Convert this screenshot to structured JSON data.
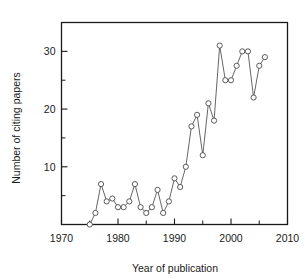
{
  "chart_data": {
    "type": "line",
    "title": "",
    "subtitle": "",
    "xlabel": "Year of publication",
    "ylabel": "Number of citing papers",
    "xlim": [
      1970,
      2010
    ],
    "ylim": [
      0,
      35
    ],
    "grid": false,
    "legend": null,
    "marker": "open-circle",
    "line_color": "#555555",
    "marker_face_color": "#ffffff",
    "marker_edge_color": "#4a4a4a",
    "x_ticks_major": [
      1970,
      1980,
      1990,
      2000,
      2010
    ],
    "x_tick_labels": [
      "1970",
      "1980",
      "1990",
      "2000",
      "2010"
    ],
    "x_ticks_minor": [
      1975,
      1985,
      1995,
      2005
    ],
    "y_ticks_major": [
      10,
      20,
      30
    ],
    "y_tick_labels": [
      "10",
      "20",
      "30"
    ],
    "y_ticks_minor": [
      5,
      15,
      25,
      35
    ],
    "x": [
      1975,
      1976,
      1977,
      1978,
      1979,
      1980,
      1981,
      1982,
      1983,
      1984,
      1985,
      1986,
      1987,
      1988,
      1989,
      1990,
      1991,
      1992,
      1993,
      1994,
      1995,
      1996,
      1997,
      1998,
      1999,
      2000,
      2001,
      2002,
      2003,
      2004,
      2005,
      2006
    ],
    "values": [
      0,
      2,
      7,
      4,
      4.5,
      3,
      3,
      4,
      7,
      3,
      2,
      3,
      6,
      2,
      4,
      8,
      6.5,
      10,
      17,
      19,
      12,
      21,
      18,
      31,
      25,
      25,
      27.5,
      30,
      30,
      22,
      27.5,
      29
    ],
    "xtick_label_positions": [
      1970,
      1980,
      1990,
      2000,
      2010
    ],
    "series_name": "citing papers"
  },
  "axes": {
    "y_label_text": "Number of citing papers",
    "x_label_text": "Year of publication"
  }
}
